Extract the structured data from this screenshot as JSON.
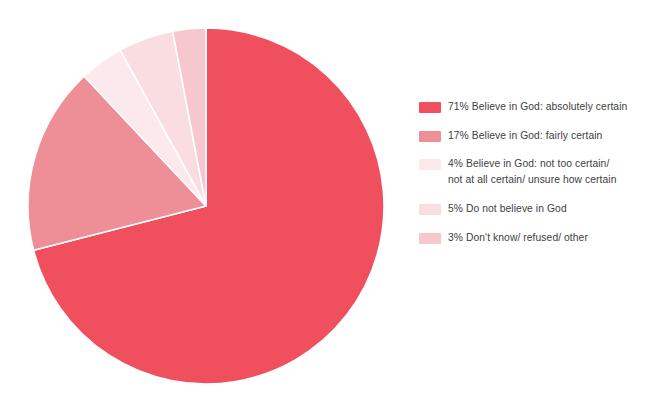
{
  "chart_data": {
    "type": "pie",
    "title": "",
    "subtitle": "",
    "xlabel": "",
    "ylabel": "",
    "grid": false,
    "legend_position": "right",
    "unit": "%",
    "total": 100,
    "start_angle_deg": 0,
    "direction": "clockwise",
    "categories": [
      "Believe in God: absolutely certain",
      "Believe in God: fairly certain",
      "Believe in God: not too certain/ not at all certain/ unsure how certain",
      "Do not believe in God",
      "Don't know/ refused/ other"
    ],
    "values": [
      71,
      17,
      4,
      5,
      3
    ],
    "colors": [
      "#F0505E",
      "#EE8E97",
      "#FBE9EC",
      "#F9DDE1",
      "#F6C8CE"
    ],
    "slices": [
      {
        "label": "Believe in God: absolutely certain",
        "value": 71,
        "value_text": "71%",
        "color": "#F0505E"
      },
      {
        "label": "Believe in God: fairly certain",
        "value": 17,
        "value_text": "17%",
        "color": "#EE8E97"
      },
      {
        "label": "Believe in God: not too certain/ not at all certain/ unsure how certain",
        "value": 4,
        "value_text": "4%",
        "color": "#FBE9EC"
      },
      {
        "label": "Do not believe in God",
        "value": 5,
        "value_text": "5%",
        "color": "#F9DDE1"
      },
      {
        "label": "Don't know/ refused/ other",
        "value": 3,
        "value_text": "3%",
        "color": "#F6C8CE"
      }
    ]
  },
  "legend": {
    "items": [
      {
        "swatch_color": "#F0505E",
        "text": "71% Believe in God: absolutely certain"
      },
      {
        "swatch_color": "#EE8E97",
        "text": "17% Believe in God: fairly certain"
      },
      {
        "swatch_color": "#FBE9EC",
        "text": "4% Believe in God: not too certain/\nnot at all certain/ unsure how certain"
      },
      {
        "swatch_color": "#F9DDE1",
        "text": "5% Do not believe in God"
      },
      {
        "swatch_color": "#F6C8CE",
        "text": "3% Don't know/ refused/ other"
      }
    ]
  },
  "pie_geometry": {
    "cx": 178,
    "cy": 178,
    "r": 178,
    "separator_color": "#ffffff",
    "separator_width": 1.6
  }
}
